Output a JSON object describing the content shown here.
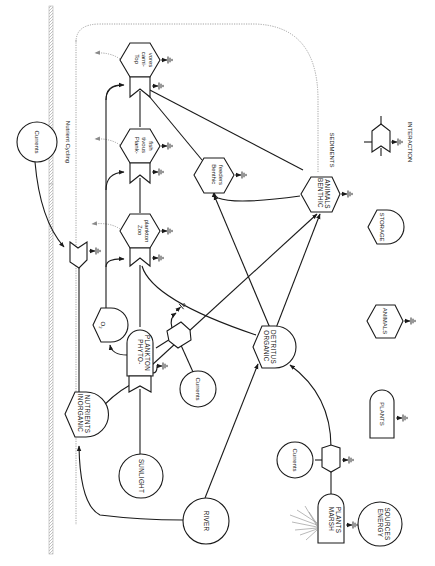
{
  "diagram": {
    "labels": {
      "nutrient_cycling": "Nutrient Cycling",
      "sediments": "SEDIMENTS",
      "currents_top": "Currents",
      "currents_mid": "Currents",
      "currents_bottom": "Currents",
      "top_carnivores": [
        "Top",
        "carni-",
        "vores"
      ],
      "planktivorous_fish": [
        "Plank-",
        "tivous",
        "fish"
      ],
      "zooplankton": [
        "Zoo",
        "plankton"
      ],
      "benthic_feeders": [
        "Benthic",
        "feeders"
      ],
      "benthic_animals": [
        "BENTHIC",
        "ANIMALS"
      ],
      "oxygen": "O",
      "oxygen_sub": "2",
      "phytoplankton": [
        "PHYTO-",
        "PLANKTON"
      ],
      "organic_detritus": [
        "ORGANIC",
        "DETRITUS"
      ],
      "inorganic_nutrients": [
        "INORGANIC",
        "NUTRIENTS"
      ],
      "sunlight": "SUNLIGHT",
      "river": "RIVER",
      "marsh_plants": [
        "MARSH",
        "PLANTS"
      ],
      "energy_sources": [
        "ENERGY",
        "SOURCES"
      ]
    },
    "legend": {
      "interaction": "INTERACTION",
      "storage": "STORAGE",
      "animals": "ANIMALS",
      "plants": "PLANTS"
    }
  }
}
